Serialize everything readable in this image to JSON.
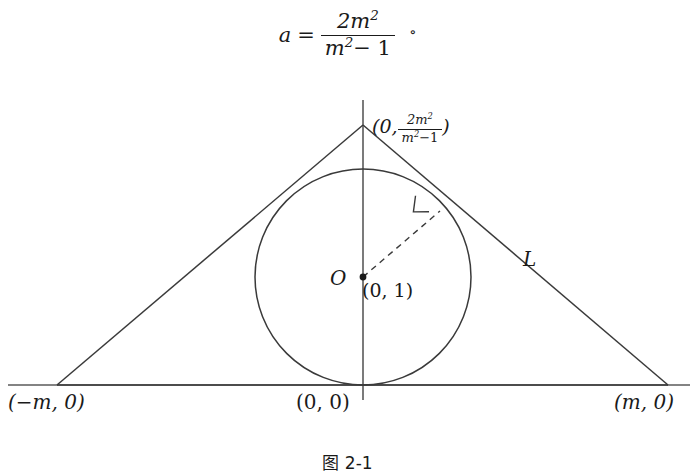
{
  "figure": {
    "caption": "图 2-1",
    "formula": {
      "lhs": "a",
      "equals": "=",
      "numerator": "2m",
      "numerator_exponent": "2",
      "denominator_base": "m",
      "denominator_exponent": "2",
      "denominator_tail": "− 1",
      "degree_symbol": "∘"
    },
    "labels": {
      "apex_prefix": "(0,",
      "apex_numerator": "2m",
      "apex_numerator_exponent": "2",
      "apex_denominator_base": "m",
      "apex_denominator_exponent": "2",
      "apex_denominator_tail": "−1",
      "apex_suffix": ")",
      "center_point": "O",
      "center_coordinate": "(0, 1)",
      "tangent_line": "L",
      "left_vertex": "(−m, 0)",
      "origin": "(0, 0)",
      "right_vertex": "(m, 0)"
    },
    "geometry": {
      "apex": {
        "x": 363,
        "y": 125
      },
      "left_vertex": {
        "x": 57,
        "y": 385
      },
      "right_vertex": {
        "x": 668,
        "y": 385
      },
      "circle_center": {
        "x": 363,
        "y": 277
      },
      "circle_radius": 108,
      "tangent_point_right": {
        "x": 440,
        "y": 211
      },
      "tangent_point_left": {
        "x": 287,
        "y": 211
      },
      "x_axis_y": 385,
      "x_axis_start": 8,
      "x_axis_end": 690,
      "y_axis_x": 363,
      "y_axis_top": 100,
      "y_axis_bottom": 400
    },
    "colors": {
      "stroke": "#3a3a3a",
      "axis": "#5a5a5a",
      "text": "#1a1a1a",
      "background": "#ffffff"
    }
  }
}
